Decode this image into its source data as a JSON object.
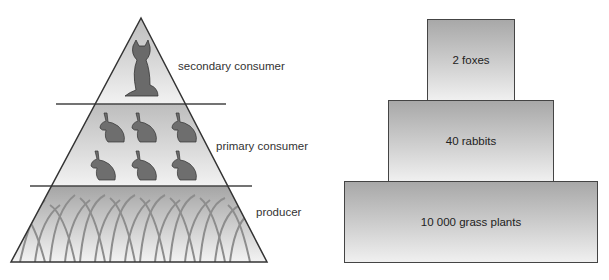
{
  "pyramid_of_numbers": {
    "levels": [
      {
        "trophic_level": "secondary consumer",
        "organism": "fox",
        "count_icons": 1
      },
      {
        "trophic_level": "primary consumer",
        "organism": "rabbit",
        "count_icons": 6
      },
      {
        "trophic_level": "producer",
        "organism": "grass"
      }
    ]
  },
  "bar_pyramid": {
    "boxes": [
      {
        "label": "2 foxes"
      },
      {
        "label": "40 rabbits"
      },
      {
        "label": "10 000 grass plants"
      }
    ]
  },
  "colors": {
    "outline": "#444444",
    "fill_dark": "#a8a8a8",
    "fill_light": "#f0f0f0"
  }
}
